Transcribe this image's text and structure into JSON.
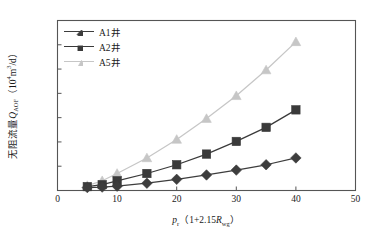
{
  "chart_data": {
    "type": "line",
    "title": "",
    "xlabel": "p_r (1+2.15R_wg)",
    "ylabel": "无阻流量Q_AOF (10^4 m^3/d)",
    "xlim": [
      0,
      50
    ],
    "ylim": [
      0,
      3500
    ],
    "grid": false,
    "legend_position": "top-left",
    "xticks": [
      0,
      10,
      20,
      30,
      40,
      50
    ],
    "yticks": [
      0,
      500,
      1000,
      1500,
      2000,
      2500,
      3000,
      3500
    ],
    "x": [
      5,
      7.5,
      10,
      15,
      20,
      25,
      30,
      35,
      40
    ],
    "series": [
      {
        "name": "A1井",
        "marker": "diamond",
        "color": "#3d3d3d",
        "values": [
          60,
          70,
          90,
          150,
          230,
          320,
          420,
          530,
          670
        ]
      },
      {
        "name": "A2井",
        "marker": "square",
        "color": "#3a3a3a",
        "values": [
          80,
          120,
          200,
          350,
          530,
          750,
          1010,
          1300,
          1660
        ]
      },
      {
        "name": "A5井",
        "marker": "triangle",
        "color": "#c6c6c6",
        "values": [
          100,
          200,
          350,
          670,
          1050,
          1480,
          1950,
          2480,
          3060
        ]
      }
    ]
  },
  "axes": {
    "y_label_text": "无阻流量",
    "y_label_var": "Q",
    "y_label_var_sub": "AOF",
    "y_label_units_open": "（10",
    "y_label_units_exp": "4",
    "y_label_units_mid": "m",
    "y_label_units_exp2": "3",
    "y_label_units_close": "/d）",
    "x_label_var": "p",
    "x_label_var_sub": "r",
    "x_label_expr_open": "（1+2.15",
    "x_label_expr_var": "R",
    "x_label_expr_sub": "wg",
    "x_label_expr_close": "）",
    "ytick_labels": [
      "0",
      "500",
      "1000",
      "1500",
      "2000",
      "2500",
      "3000",
      "3500"
    ],
    "xtick_labels": [
      "0",
      "10",
      "20",
      "30",
      "40",
      "50"
    ]
  },
  "legend": {
    "items": [
      {
        "label": "A1井",
        "marker": "diamond-marker",
        "color": "#3d3d3d"
      },
      {
        "label": "A2井",
        "marker": "square-marker",
        "color": "#3a3a3a"
      },
      {
        "label": "A5井",
        "marker": "triangle-marker",
        "color": "#c6c6c6"
      }
    ]
  },
  "style": {
    "frame_color": "#555555",
    "text_color": "#1a1a1a",
    "background": "#ffffff"
  }
}
